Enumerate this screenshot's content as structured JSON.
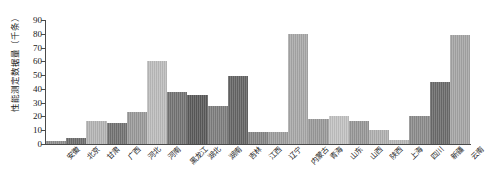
{
  "chart_data": {
    "type": "bar",
    "title": "",
    "xlabel": "",
    "ylabel": "性能测定数据量（千条）",
    "ylim": [
      0,
      90
    ],
    "ytick_step": 10,
    "yticks": [
      0,
      10,
      20,
      30,
      40,
      50,
      60,
      70,
      80,
      90
    ],
    "grid": false,
    "legend": false,
    "categories": [
      "安徽",
      "北京",
      "甘肃",
      "广西",
      "河北",
      "河南",
      "黑龙江",
      "湖北",
      "湖南",
      "吉林",
      "江西",
      "辽宁",
      "内蒙古",
      "青海",
      "山东",
      "山西",
      "陕西",
      "上海",
      "四川",
      "新疆",
      "云南"
    ],
    "values": [
      2.5,
      4.5,
      17,
      15,
      23,
      60.5,
      38,
      35.5,
      27.5,
      49.5,
      9,
      8.5,
      80,
      18,
      20,
      16.5,
      10,
      3,
      20,
      45,
      79
    ],
    "bar_colors": [
      "#8f8f8f",
      "#6e6e6e",
      "#b4b4b4",
      "#737373",
      "#9a9a9a",
      "#bcbcbc",
      "#747474",
      "#5a5a5a",
      "#7e7e7e",
      "#656565",
      "#868686",
      "#9e9e9e",
      "#a8a8a8",
      "#9a9a9a",
      "#c2c2c2",
      "#989898",
      "#b0b0b0",
      "#b8b8b8",
      "#8c8c8c",
      "#6b6b6b",
      "#a5a5a5"
    ],
    "axis_color": "#4a4a4a",
    "background": "#ffffff"
  }
}
